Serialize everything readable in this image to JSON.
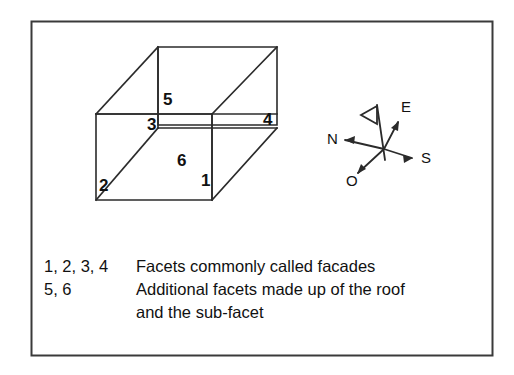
{
  "figure": {
    "title_visible": false,
    "border_color": "#3a3a3a",
    "line_color": "#2b2b2b",
    "background": "#ffffff"
  },
  "diagram": {
    "shape": "box",
    "facet_labels": [
      {
        "id": "facet-1",
        "text": "1",
        "x": 201,
        "y": 186
      },
      {
        "id": "facet-2",
        "text": "2",
        "x": 99,
        "y": 191
      },
      {
        "id": "facet-3",
        "text": "3",
        "x": 147,
        "y": 130
      },
      {
        "id": "facet-4",
        "text": "4",
        "x": 263,
        "y": 125
      },
      {
        "id": "facet-5",
        "text": "5",
        "x": 163,
        "y": 105
      },
      {
        "id": "facet-6",
        "text": "6",
        "x": 177,
        "y": 166
      }
    ]
  },
  "compass": {
    "labels": [
      {
        "id": "compass-n",
        "text": "N",
        "x": 327,
        "y": 144
      },
      {
        "id": "compass-e",
        "text": "E",
        "x": 401,
        "y": 112
      },
      {
        "id": "compass-s",
        "text": "S",
        "x": 421,
        "y": 163
      },
      {
        "id": "compass-o",
        "text": "O",
        "x": 346,
        "y": 186
      }
    ]
  },
  "legend": {
    "rows": [
      {
        "keys": "1, 2, 3, 4",
        "description": "Facets commonly called facades"
      },
      {
        "keys": "5, 6",
        "description": "Additional facets made up of the roof"
      },
      {
        "keys": "",
        "description": "and the sub-facet"
      }
    ]
  }
}
